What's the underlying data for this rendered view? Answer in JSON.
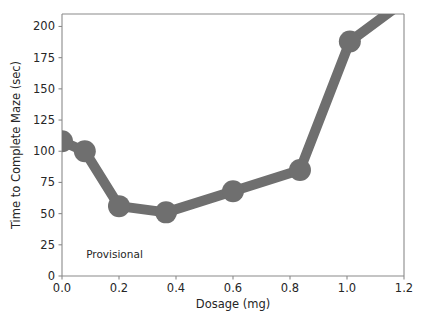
{
  "chart_data": {
    "type": "line",
    "title": "",
    "xlabel": "Dosage (mg)",
    "ylabel": "Time to Complete Maze (sec)",
    "xlim": [
      0.0,
      1.2
    ],
    "ylim": [
      0,
      210
    ],
    "grid": false,
    "legend": null,
    "line_color": "#6f6f6f",
    "marker": "circle",
    "x": [
      0.0,
      0.08,
      0.2,
      0.365,
      0.6,
      0.835,
      1.01,
      1.17
    ],
    "values": [
      108,
      100,
      56,
      51,
      68,
      85,
      188,
      215
    ],
    "series": [
      {
        "name": "Time to Complete Maze",
        "x": [
          0.0,
          0.08,
          0.2,
          0.365,
          0.6,
          0.835,
          1.01,
          1.17
        ],
        "values": [
          108,
          100,
          56,
          51,
          68,
          85,
          188,
          215
        ]
      }
    ],
    "xticks": [
      0.0,
      0.2,
      0.4,
      0.6,
      0.8,
      1.0,
      1.2
    ],
    "xticklabels": [
      "0.0",
      "0.2",
      "0.4",
      "0.6",
      "0.8",
      "1.0",
      "1.2"
    ],
    "yticks": [
      0,
      25,
      50,
      75,
      100,
      125,
      150,
      175,
      200
    ],
    "yticklabels": [
      "0",
      "25",
      "50",
      "75",
      "100",
      "125",
      "150",
      "175",
      "200"
    ],
    "annotations": [
      {
        "text": "Provisional",
        "x": 0.085,
        "y": 18
      }
    ]
  }
}
